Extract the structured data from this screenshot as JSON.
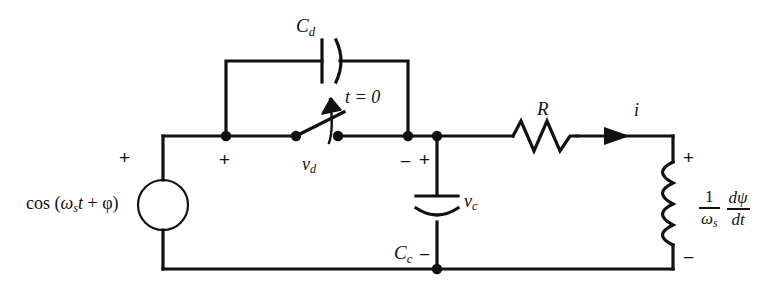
{
  "diagram": {
    "stroke_color": "#111111",
    "background_color": "#ffffff"
  },
  "labels": {
    "source_expression": "cos (ωₛt + φ)",
    "source_cos": "cos (",
    "source_omega": "ω",
    "source_omega_sub": "s",
    "source_t": "t",
    "source_plus_phi": " + φ)",
    "cap_damping": "C",
    "cap_damping_sub": "d",
    "cap_commutating": "C",
    "cap_commutating_sub": "c",
    "switch_time": "t = 0",
    "voltage_d": "v",
    "voltage_d_sub": "d",
    "voltage_c": "v",
    "voltage_c_sub": "c",
    "resistor": "R",
    "current": "i",
    "inductor_num_left": "1",
    "inductor_den_left": "ω",
    "inductor_den_left_sub": "s",
    "inductor_num_right": "dψ",
    "inductor_den_right": "dt",
    "plus": "+",
    "minus": "−"
  },
  "polarity_marks": [
    {
      "name": "source-plus",
      "sign": "+",
      "x": 119,
      "y": 148
    },
    {
      "name": "vd-plus",
      "sign": "+",
      "x": 219,
      "y": 150
    },
    {
      "name": "vd-minus",
      "sign": "−",
      "x": 400,
      "y": 152
    },
    {
      "name": "vc-plus",
      "sign": "+",
      "x": 419,
      "y": 150
    },
    {
      "name": "vc-minus",
      "sign": "−",
      "x": 419,
      "y": 245
    },
    {
      "name": "inductor-plus",
      "sign": "+",
      "x": 683,
      "y": 148
    },
    {
      "name": "inductor-minus",
      "sign": "−",
      "x": 683,
      "y": 248
    }
  ],
  "nodes": [
    {
      "name": "node-cd-left",
      "x": 226,
      "y": 136
    },
    {
      "name": "node-switch-left",
      "x": 296,
      "y": 136
    },
    {
      "name": "node-switch-right",
      "x": 338,
      "y": 136
    },
    {
      "name": "node-cd-right",
      "x": 408,
      "y": 136
    },
    {
      "name": "node-cc-top",
      "x": 437,
      "y": 136
    },
    {
      "name": "node-cc-bottom",
      "x": 437,
      "y": 269
    }
  ],
  "geometry": {
    "top_rail_y": 136,
    "bottom_rail_y": 269,
    "left_rail_x": 163,
    "right_rail_x": 673,
    "source_center": {
      "x": 163,
      "y": 205,
      "r": 25
    },
    "cd_branch_y": 61,
    "resistor_span": {
      "x1": 513,
      "y": 136,
      "x2": 577
    },
    "inductor_span": {
      "x": 673,
      "y1": 162,
      "y2": 245
    },
    "current_arrow_x": 620
  }
}
